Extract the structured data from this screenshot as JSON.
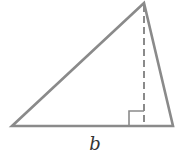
{
  "diagram": {
    "type": "triangle-with-altitude",
    "stroke_color": "#8a8a8a",
    "label_color": "#333333",
    "vertices": {
      "left": [
        12,
        126
      ],
      "right": [
        173,
        126
      ],
      "apex": [
        144,
        3
      ]
    },
    "altitude": {
      "from": [
        144,
        3
      ],
      "to": [
        144,
        126
      ],
      "style": "dashed"
    },
    "right_angle_marker": {
      "x": 129,
      "y": 111,
      "size": 15
    },
    "labels": {
      "base": "b"
    }
  }
}
